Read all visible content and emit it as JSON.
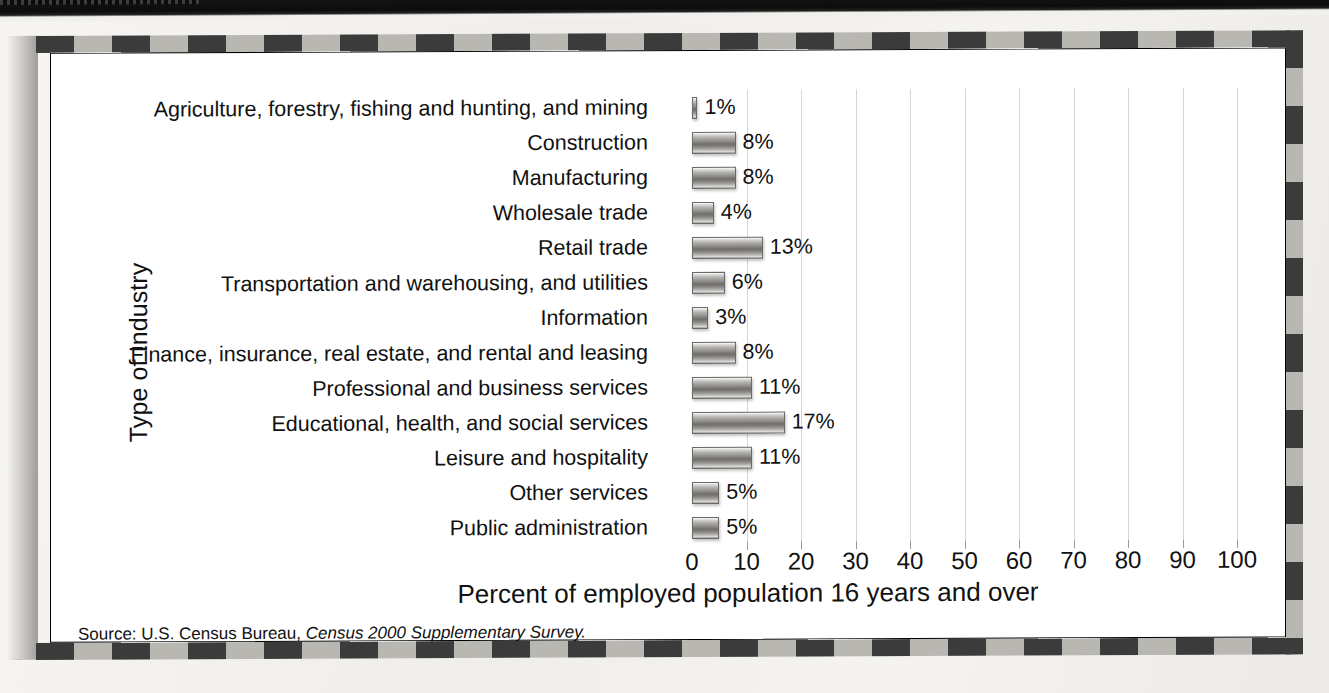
{
  "figure": {
    "y_axis_title": "Type of Industry",
    "x_axis_title": "Percent of employed population 16 years and over",
    "source_prefix": "Source: U.S. Census Bureau,",
    "source_italic": "Census 2000 Supplementary Survey.",
    "frame_dark_color": "#3b3b3b",
    "frame_light_color": "#b9b7b2",
    "gridline_color": "#d6d6d6",
    "bar_color": "#8e8c89"
  },
  "chart_data": {
    "type": "bar",
    "orientation": "horizontal",
    "title": "",
    "xlabel": "Percent of employed population 16 years and over",
    "ylabel": "Type of Industry",
    "xlim": [
      0,
      100
    ],
    "xticks": [
      0,
      10,
      20,
      30,
      40,
      50,
      60,
      70,
      80,
      90,
      100
    ],
    "xtick_labels": [
      "0",
      "10",
      "20",
      "30",
      "40",
      "50",
      "60",
      "70",
      "80",
      "90",
      "100"
    ],
    "grid": "vertical",
    "legend": "none",
    "value_suffix": "%",
    "categories": [
      "Agriculture, forestry, fishing and hunting, and mining",
      "Construction",
      "Manufacturing",
      "Wholesale trade",
      "Retail trade",
      "Transportation and warehousing, and utilities",
      "Information",
      "Finance, insurance, real estate, and rental and leasing",
      "Professional and business services",
      "Educational, health, and social services",
      "Leisure and hospitality",
      "Other services",
      "Public administration"
    ],
    "values": [
      1,
      8,
      8,
      4,
      13,
      6,
      3,
      8,
      11,
      17,
      11,
      5,
      5
    ],
    "value_labels": [
      "1%",
      "8%",
      "8%",
      "4%",
      "13%",
      "6%",
      "3%",
      "8%",
      "11%",
      "17%",
      "11%",
      "5%",
      "5%"
    ]
  }
}
